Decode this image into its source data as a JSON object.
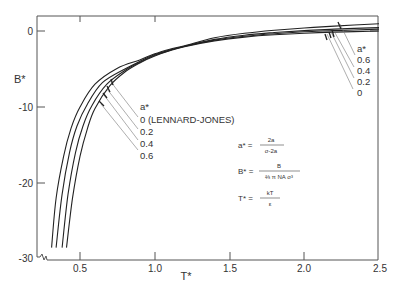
{
  "chart_data": {
    "type": "line",
    "title": "",
    "xlabel": "T*",
    "ylabel": "B*",
    "xlim": [
      0.5,
      2.5
    ],
    "ylim": [
      -30,
      2
    ],
    "x_ticks": [
      "0.5",
      "1.0",
      "1.5",
      "2.0",
      "2.5"
    ],
    "y_ticks": [
      "0",
      "-10",
      "-20",
      "-30"
    ],
    "grid": false,
    "legend_title": "a*",
    "series": [
      {
        "name": "0 (LENNARD-JONES)",
        "a_star": 0,
        "x": [
          0.41,
          0.45,
          0.5,
          0.55,
          0.6,
          0.7,
          0.8,
          0.9,
          1.0,
          1.1,
          1.2,
          1.4,
          1.6,
          1.8,
          2.0,
          2.2,
          2.5
        ],
        "y": [
          -28.5,
          -22.0,
          -16.5,
          -12.8,
          -10.2,
          -7.2,
          -5.4,
          -4.2,
          -3.3,
          -2.6,
          -2.05,
          -1.3,
          -0.8,
          -0.5,
          -0.3,
          -0.15,
          0.0
        ]
      },
      {
        "name": "0.2",
        "a_star": 0.2,
        "x": [
          0.38,
          0.42,
          0.47,
          0.52,
          0.58,
          0.68,
          0.8,
          0.9,
          1.0,
          1.1,
          1.2,
          1.4,
          1.6,
          1.8,
          2.0,
          2.2,
          2.5
        ],
        "y": [
          -28.5,
          -21.5,
          -16.0,
          -12.5,
          -9.8,
          -7.0,
          -5.2,
          -4.1,
          -3.2,
          -2.55,
          -2.0,
          -1.2,
          -0.7,
          -0.35,
          -0.1,
          0.05,
          0.25
        ]
      },
      {
        "name": "0.4",
        "a_star": 0.4,
        "x": [
          0.34,
          0.38,
          0.43,
          0.48,
          0.55,
          0.65,
          0.8,
          0.9,
          1.0,
          1.1,
          1.2,
          1.4,
          1.6,
          1.8,
          2.0,
          2.2,
          2.5
        ],
        "y": [
          -28.5,
          -21.5,
          -16.0,
          -12.5,
          -9.6,
          -6.8,
          -5.0,
          -4.0,
          -3.1,
          -2.5,
          -2.0,
          -1.1,
          -0.55,
          -0.2,
          0.05,
          0.25,
          0.45
        ]
      },
      {
        "name": "0.6",
        "a_star": 0.6,
        "x": [
          0.31,
          0.34,
          0.39,
          0.44,
          0.5,
          0.6,
          0.75,
          0.9,
          1.0,
          1.1,
          1.2,
          1.4,
          1.6,
          1.8,
          2.0,
          2.2,
          2.5
        ],
        "y": [
          -28.5,
          -22.0,
          -16.5,
          -12.8,
          -10.0,
          -7.0,
          -4.9,
          -3.8,
          -3.0,
          -2.4,
          -1.95,
          -0.9,
          -0.3,
          0.1,
          0.4,
          0.65,
          0.95
        ]
      }
    ],
    "annotations": {
      "left_labels": [
        "a*",
        "0 (LENNARD-JONES)",
        "0.2",
        "0.4",
        "0.6"
      ],
      "right_labels": [
        "a*",
        "0.6",
        "0.4",
        "0.2",
        "0"
      ],
      "equations": [
        {
          "lhs": "a*",
          "num": "2a",
          "den": "σ-2a"
        },
        {
          "lhs": "B*",
          "num": "B",
          "den": "2/3 π N_A σ³"
        },
        {
          "lhs": "T*",
          "num": "kT",
          "den": "ε"
        }
      ]
    }
  },
  "axes": {
    "xlabel": "T*",
    "ylabel": "B*",
    "x_ticks": [
      "0.5",
      "1.0",
      "1.5",
      "2.0",
      "2.5"
    ],
    "y_ticks": [
      "0",
      "-10",
      "-20",
      "-30"
    ]
  },
  "labels": {
    "left": {
      "title": "a*",
      "items": [
        "0  (LENNARD-JONES)",
        "0.2",
        "0.4",
        "0.6"
      ]
    },
    "right": {
      "title": "a*",
      "items": [
        "0.6",
        "0.4",
        "0.2",
        "0"
      ]
    }
  },
  "equations": {
    "a_lhs": "a* =",
    "a_num": "2a",
    "a_den": "σ-2a",
    "b_lhs": "B* =",
    "b_num": "B",
    "b_den": "⅔ π NA σ³",
    "t_lhs": "T* =",
    "t_num": "kT",
    "t_den": "ε"
  },
  "colors": {
    "line": "#222222",
    "frame": "#555555",
    "leader": "#777777"
  }
}
